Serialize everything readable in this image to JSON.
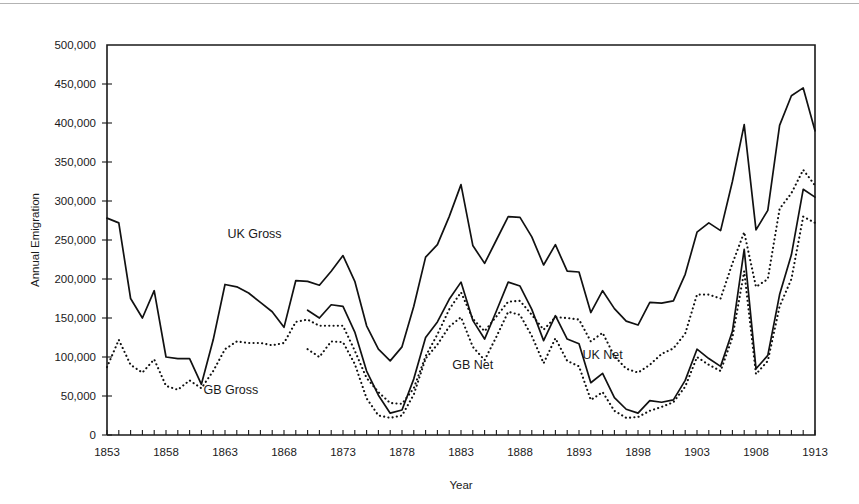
{
  "figure": {
    "background": "#ffffff",
    "ink_color": "#111111",
    "scan_artifact": true
  },
  "chart_data": {
    "type": "line",
    "title": "",
    "xlabel": "Year",
    "ylabel": "Annual Emigration",
    "xlim": [
      1853,
      1913
    ],
    "ylim": [
      0,
      500000
    ],
    "ytick_step": 50000,
    "xtick_step": 1,
    "xtick_label_step": 5,
    "grid": false,
    "legend": "inline-labels",
    "ytick_labels": [
      "0",
      "50,000",
      "100,000",
      "150,000",
      "200,000",
      "250,000",
      "300,000",
      "350,000",
      "400,000",
      "450,000",
      "500,000"
    ],
    "ytick_values": [
      0,
      50000,
      100000,
      150000,
      200000,
      250000,
      300000,
      350000,
      400000,
      450000,
      500000
    ],
    "xtick_labels": [
      "1853",
      "1858",
      "1863",
      "1868",
      "1873",
      "1878",
      "1883",
      "1888",
      "1893",
      "1898",
      "1903",
      "1908",
      "1913"
    ],
    "xtick_values": [
      1853,
      1858,
      1863,
      1868,
      1873,
      1878,
      1883,
      1888,
      1893,
      1898,
      1903,
      1908,
      1913
    ],
    "x": [
      1853,
      1854,
      1855,
      1856,
      1857,
      1858,
      1859,
      1860,
      1861,
      1862,
      1863,
      1864,
      1865,
      1866,
      1867,
      1868,
      1869,
      1870,
      1871,
      1872,
      1873,
      1874,
      1875,
      1876,
      1877,
      1878,
      1879,
      1880,
      1881,
      1882,
      1883,
      1884,
      1885,
      1886,
      1887,
      1888,
      1889,
      1890,
      1891,
      1892,
      1893,
      1894,
      1895,
      1896,
      1897,
      1898,
      1899,
      1900,
      1901,
      1902,
      1903,
      1904,
      1905,
      1906,
      1907,
      1908,
      1909,
      1910,
      1911,
      1912,
      1913
    ],
    "series": [
      {
        "name": "UK Gross",
        "style": "solid",
        "label_x": 1865.5,
        "label_y": 252000,
        "values": [
          278000,
          272000,
          175000,
          150000,
          185000,
          100000,
          98000,
          98000,
          65000,
          122000,
          193000,
          190000,
          182000,
          170000,
          158000,
          138000,
          198000,
          197000,
          192000,
          210000,
          230000,
          197000,
          140000,
          110000,
          95000,
          113000,
          165000,
          228000,
          244000,
          280000,
          321000,
          243000,
          220000,
          250000,
          280000,
          279000,
          254000,
          218000,
          244000,
          210000,
          209000,
          157000,
          185000,
          162000,
          146000,
          141000,
          170000,
          169000,
          172000,
          206000,
          260000,
          272000,
          262000,
          325000,
          398000,
          263000,
          288000,
          397000,
          435000,
          445000,
          390000
        ]
      },
      {
        "name": "GB Gross",
        "style": "dotted",
        "label_x": 1863.5,
        "label_y": 52000,
        "values": [
          87000,
          122000,
          90000,
          80000,
          97000,
          63000,
          58000,
          70000,
          60000,
          82000,
          110000,
          120000,
          118000,
          118000,
          115000,
          118000,
          145000,
          148000,
          140000,
          140000,
          140000,
          108000,
          73000,
          55000,
          41000,
          40000,
          60000,
          101000,
          129000,
          161000,
          183000,
          149000,
          133000,
          152000,
          171000,
          172000,
          154000,
          135000,
          151000,
          150000,
          148000,
          120000,
          131000,
          101000,
          85000,
          80000,
          90000,
          104000,
          111000,
          130000,
          180000,
          180000,
          175000,
          220000,
          260000,
          190000,
          200000,
          290000,
          310000,
          340000,
          320000
        ]
      },
      {
        "name": "UK Net",
        "style": "solid",
        "label_x": 1895.0,
        "label_y": 98000,
        "values": [
          null,
          null,
          null,
          null,
          null,
          null,
          null,
          null,
          null,
          null,
          null,
          null,
          null,
          null,
          null,
          null,
          null,
          160000,
          150000,
          167000,
          165000,
          132000,
          82000,
          51000,
          28000,
          32000,
          72000,
          125000,
          145000,
          174000,
          196000,
          147000,
          123000,
          159000,
          196000,
          191000,
          161000,
          121000,
          153000,
          123000,
          117000,
          67000,
          79000,
          48000,
          33000,
          28000,
          44000,
          42000,
          45000,
          70000,
          110000,
          98000,
          88000,
          133000,
          238000,
          85000,
          102000,
          180000,
          231000,
          315000,
          305000
        ]
      },
      {
        "name": "GB Net",
        "style": "dotted",
        "label_x": 1884.0,
        "label_y": 85000,
        "values": [
          null,
          null,
          null,
          null,
          null,
          null,
          null,
          null,
          null,
          null,
          null,
          null,
          null,
          null,
          null,
          null,
          null,
          110000,
          100000,
          120000,
          119000,
          91000,
          47000,
          25000,
          22000,
          25000,
          52000,
          98000,
          116000,
          139000,
          151000,
          113000,
          96000,
          126000,
          158000,
          154000,
          127000,
          92000,
          124000,
          95000,
          88000,
          45000,
          55000,
          31000,
          22000,
          23000,
          31000,
          36000,
          42000,
          62000,
          100000,
          90000,
          82000,
          125000,
          210000,
          78000,
          95000,
          165000,
          200000,
          280000,
          272000
        ]
      }
    ]
  }
}
